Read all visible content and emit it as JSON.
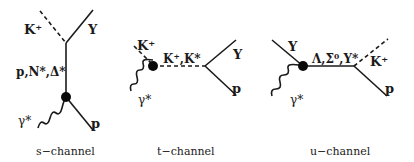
{
  "diagrams": [
    {
      "id": "s",
      "caption": "s−channel",
      "labels": {
        "meson": "K⁺",
        "hyperon": "Y",
        "intermediate": "p,N*,Δ*",
        "photon": "γ*",
        "proton": "p"
      }
    },
    {
      "id": "t",
      "caption": "t−channel",
      "labels": {
        "meson": "K⁺",
        "intermediate": "K⁺,K*",
        "photon": "γ*",
        "hyperon": "Y",
        "proton": "p"
      }
    },
    {
      "id": "u",
      "caption": "u−channel",
      "labels": {
        "hyperon": "Y",
        "intermediate": "Λ,Σ⁰,Y*",
        "photon": "γ*",
        "meson": "K⁺",
        "proton": "p"
      }
    }
  ],
  "line_styles": {
    "solid": "baryon",
    "dashed": "meson",
    "wavy": "photon",
    "dot": "vertex"
  },
  "colors": {
    "ink": "#1a1a1a",
    "background": "#ffffff"
  }
}
